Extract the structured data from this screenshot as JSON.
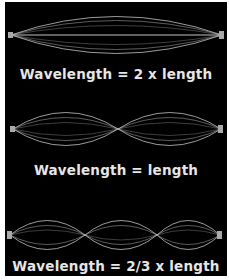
{
  "panels": [
    {
      "caption": "Wavelength = 2 x length",
      "half_waves": 1
    },
    {
      "caption": "Wavelength = length",
      "half_waves": 2
    },
    {
      "caption": "Wavelength = 2/3 x length",
      "half_waves": 3
    }
  ],
  "colors": {
    "background": "#000000",
    "wave": "#d8d8d8",
    "text": "#e6e6e6",
    "border": "#ffffff"
  }
}
